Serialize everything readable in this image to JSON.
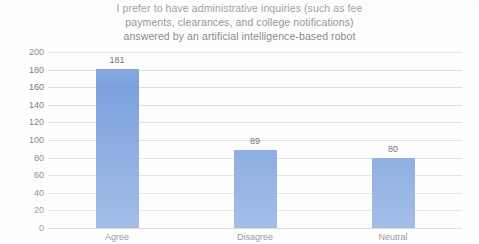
{
  "chart_data": {
    "type": "bar",
    "title": "I prefer to have administrative inquiries (such as fee\npayments, clearances, and college notifications)\nanswered by an artificial intelligence-based robot",
    "categories": [
      "Agree",
      "Disagree",
      "Neutral"
    ],
    "values": [
      181,
      89,
      80
    ],
    "data_labels": [
      "181",
      "89",
      "80"
    ],
    "xlabel": "",
    "ylabel": "",
    "ylim": [
      0,
      200
    ],
    "ytick_step": 20,
    "yticks": [
      "200",
      "180",
      "160",
      "140",
      "120",
      "100",
      "80",
      "60",
      "40",
      "20",
      "0"
    ],
    "ytick_values": [
      200,
      180,
      160,
      140,
      120,
      100,
      80,
      60,
      40,
      20,
      0
    ],
    "grid": true,
    "legend": false,
    "series": [
      {
        "name": "Responses",
        "values": [
          181,
          89,
          80
        ],
        "color": "#7BA1DD"
      }
    ],
    "colors": {
      "bar": "#7BA1DD",
      "gridline": "#DEDEDE",
      "title_text": "#636363",
      "axis_text": "#757575",
      "label_text": "#5E5E5E",
      "background": "#FEFEFE"
    }
  }
}
